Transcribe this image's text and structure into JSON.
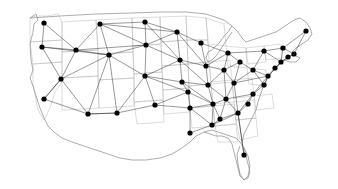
{
  "figure": {
    "width": 338,
    "height": 189,
    "background_color": "#ffffff"
  },
  "style": {
    "node_color": "#000000",
    "node_radius": 2.6,
    "edge_color": "#1a1a1a",
    "edge_width": 0.45,
    "state_border_color": "#b9b9b9",
    "nation_outline_color": "#8a8a8a"
  },
  "chart_data": {
    "type": "scatter",
    "title": "",
    "xlabel": "",
    "ylabel": "",
    "xlim": [
      0,
      338
    ],
    "ylim": [
      0,
      189
    ],
    "grid": false,
    "legend": "none",
    "node_count": 44,
    "edge_count": 96,
    "nodes": [
      {
        "id": 0,
        "label": "Seattle",
        "x": 44,
        "y": 23
      },
      {
        "id": 1,
        "label": "Portland",
        "x": 42,
        "y": 47
      },
      {
        "id": 2,
        "label": "Sacramento",
        "x": 61,
        "y": 79
      },
      {
        "id": 3,
        "label": "San Francisco",
        "x": 44,
        "y": 99
      },
      {
        "id": 4,
        "label": "Los Angeles",
        "x": 88,
        "y": 114
      },
      {
        "id": 5,
        "label": "Boise",
        "x": 76,
        "y": 50
      },
      {
        "id": 6,
        "label": "Salt Lake City",
        "x": 109,
        "y": 55
      },
      {
        "id": 7,
        "label": "Phoenix",
        "x": 117,
        "y": 113
      },
      {
        "id": 8,
        "label": "Billings",
        "x": 100,
        "y": 24
      },
      {
        "id": 9,
        "label": "Denver",
        "x": 146,
        "y": 45
      },
      {
        "id": 10,
        "label": "Albuquerque",
        "x": 145,
        "y": 76
      },
      {
        "id": 11,
        "label": "Bismarck",
        "x": 145,
        "y": 22
      },
      {
        "id": 12,
        "label": "El Paso",
        "x": 155,
        "y": 105
      },
      {
        "id": 13,
        "label": "Minneapolis",
        "x": 177,
        "y": 32
      },
      {
        "id": 14,
        "label": "Omaha",
        "x": 180,
        "y": 60
      },
      {
        "id": 15,
        "label": "Kansas City",
        "x": 182,
        "y": 82
      },
      {
        "id": 16,
        "label": "Oklahoma City",
        "x": 188,
        "y": 92
      },
      {
        "id": 17,
        "label": "Dallas",
        "x": 190,
        "y": 108
      },
      {
        "id": 18,
        "label": "Houston",
        "x": 190,
        "y": 133
      },
      {
        "id": 19,
        "label": "Milwaukee",
        "x": 201,
        "y": 43
      },
      {
        "id": 20,
        "label": "Chicago",
        "x": 206,
        "y": 66
      },
      {
        "id": 21,
        "label": "St Louis",
        "x": 208,
        "y": 85
      },
      {
        "id": 22,
        "label": "Memphis",
        "x": 213,
        "y": 104
      },
      {
        "id": 23,
        "label": "Detroit",
        "x": 228,
        "y": 53
      },
      {
        "id": 24,
        "label": "Indianapolis",
        "x": 224,
        "y": 70
      },
      {
        "id": 25,
        "label": "Nashville",
        "x": 226,
        "y": 99
      },
      {
        "id": 26,
        "label": "New Orleans",
        "x": 212,
        "y": 125
      },
      {
        "id": 27,
        "label": "Birmingham",
        "x": 220,
        "y": 119
      },
      {
        "id": 28,
        "label": "Cleveland",
        "x": 240,
        "y": 62
      },
      {
        "id": 29,
        "label": "Louisville",
        "x": 234,
        "y": 83
      },
      {
        "id": 30,
        "label": "Atlanta",
        "x": 238,
        "y": 113
      },
      {
        "id": 31,
        "label": "Pittsburgh",
        "x": 253,
        "y": 70
      },
      {
        "id": 32,
        "label": "Columbia",
        "x": 248,
        "y": 104
      },
      {
        "id": 33,
        "label": "Charlotte",
        "x": 253,
        "y": 94
      },
      {
        "id": 34,
        "label": "Jacksonville",
        "x": 244,
        "y": 155
      },
      {
        "id": 35,
        "label": "Buffalo",
        "x": 264,
        "y": 51
      },
      {
        "id": 36,
        "label": "Washington DC",
        "x": 268,
        "y": 76
      },
      {
        "id": 37,
        "label": "Richmond",
        "x": 264,
        "y": 85
      },
      {
        "id": 38,
        "label": "Philadelphia",
        "x": 275,
        "y": 68
      },
      {
        "id": 39,
        "label": "New York",
        "x": 281,
        "y": 62
      },
      {
        "id": 40,
        "label": "Albany",
        "x": 283,
        "y": 48
      },
      {
        "id": 41,
        "label": "Hartford",
        "x": 288,
        "y": 57
      },
      {
        "id": 42,
        "label": "Boston",
        "x": 294,
        "y": 54
      },
      {
        "id": 43,
        "label": "Portland ME",
        "x": 306,
        "y": 31
      }
    ],
    "edges": [
      [
        0,
        1
      ],
      [
        0,
        5
      ],
      [
        1,
        2
      ],
      [
        1,
        5
      ],
      [
        1,
        6
      ],
      [
        2,
        3
      ],
      [
        2,
        4
      ],
      [
        2,
        5
      ],
      [
        2,
        6
      ],
      [
        3,
        4
      ],
      [
        3,
        2
      ],
      [
        4,
        7
      ],
      [
        4,
        6
      ],
      [
        5,
        6
      ],
      [
        5,
        8
      ],
      [
        5,
        9
      ],
      [
        6,
        9
      ],
      [
        6,
        10
      ],
      [
        6,
        7
      ],
      [
        6,
        8
      ],
      [
        7,
        10
      ],
      [
        7,
        12
      ],
      [
        7,
        4
      ],
      [
        8,
        9
      ],
      [
        8,
        11
      ],
      [
        8,
        13
      ],
      [
        9,
        10
      ],
      [
        9,
        11
      ],
      [
        9,
        14
      ],
      [
        9,
        13
      ],
      [
        10,
        12
      ],
      [
        10,
        15
      ],
      [
        10,
        16
      ],
      [
        10,
        14
      ],
      [
        11,
        13
      ],
      [
        11,
        14
      ],
      [
        12,
        17
      ],
      [
        12,
        16
      ],
      [
        13,
        14
      ],
      [
        13,
        19
      ],
      [
        13,
        20
      ],
      [
        14,
        15
      ],
      [
        14,
        20
      ],
      [
        14,
        21
      ],
      [
        15,
        16
      ],
      [
        15,
        21
      ],
      [
        15,
        22
      ],
      [
        16,
        17
      ],
      [
        16,
        22
      ],
      [
        17,
        18
      ],
      [
        17,
        22
      ],
      [
        17,
        26
      ],
      [
        18,
        26
      ],
      [
        19,
        20
      ],
      [
        19,
        23
      ],
      [
        20,
        21
      ],
      [
        20,
        24
      ],
      [
        20,
        23
      ],
      [
        21,
        22
      ],
      [
        21,
        24
      ],
      [
        21,
        25
      ],
      [
        22,
        25
      ],
      [
        22,
        26
      ],
      [
        22,
        27
      ],
      [
        23,
        24
      ],
      [
        23,
        28
      ],
      [
        23,
        35
      ],
      [
        24,
        25
      ],
      [
        24,
        29
      ],
      [
        24,
        28
      ],
      [
        25,
        27
      ],
      [
        25,
        29
      ],
      [
        25,
        30
      ],
      [
        25,
        33
      ],
      [
        26,
        27
      ],
      [
        26,
        30
      ],
      [
        27,
        30
      ],
      [
        28,
        31
      ],
      [
        28,
        29
      ],
      [
        29,
        31
      ],
      [
        29,
        36
      ],
      [
        29,
        30
      ],
      [
        30,
        32
      ],
      [
        30,
        33
      ],
      [
        30,
        34
      ],
      [
        31,
        36
      ],
      [
        31,
        37
      ],
      [
        31,
        35
      ],
      [
        32,
        33
      ],
      [
        33,
        37
      ],
      [
        33,
        36
      ],
      [
        34,
        30
      ],
      [
        35,
        40
      ],
      [
        35,
        39
      ],
      [
        36,
        37
      ],
      [
        36,
        38
      ],
      [
        36,
        39
      ],
      [
        38,
        39
      ],
      [
        39,
        40
      ],
      [
        39,
        41
      ],
      [
        40,
        42
      ],
      [
        40,
        43
      ],
      [
        41,
        42
      ],
      [
        42,
        43
      ],
      [
        39,
        42
      ]
    ]
  }
}
